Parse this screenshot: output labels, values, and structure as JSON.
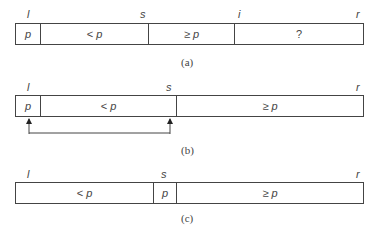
{
  "diagrams": [
    {
      "caption": "(a)",
      "indices": {
        "l": "l",
        "s": "s",
        "i": "i",
        "r": "r"
      },
      "cells": [
        {
          "op": "",
          "var": "p"
        },
        {
          "op": "< ",
          "var": "p"
        },
        {
          "op": "≥ ",
          "var": "p"
        },
        {
          "op": "",
          "var": "?"
        }
      ]
    },
    {
      "caption": "(b)",
      "indices": {
        "l": "l",
        "s": "s",
        "r": "r"
      },
      "cells": [
        {
          "op": "",
          "var": "p"
        },
        {
          "op": "< ",
          "var": "p"
        },
        {
          "op": "≥ ",
          "var": "p"
        }
      ],
      "swap_arrow": "swap p with element at s"
    },
    {
      "caption": "(c)",
      "indices": {
        "l": "l",
        "s": "s",
        "r": "r"
      },
      "cells": [
        {
          "op": "< ",
          "var": "p"
        },
        {
          "op": "",
          "var": "p"
        },
        {
          "op": "≥ ",
          "var": "p"
        }
      ]
    }
  ]
}
